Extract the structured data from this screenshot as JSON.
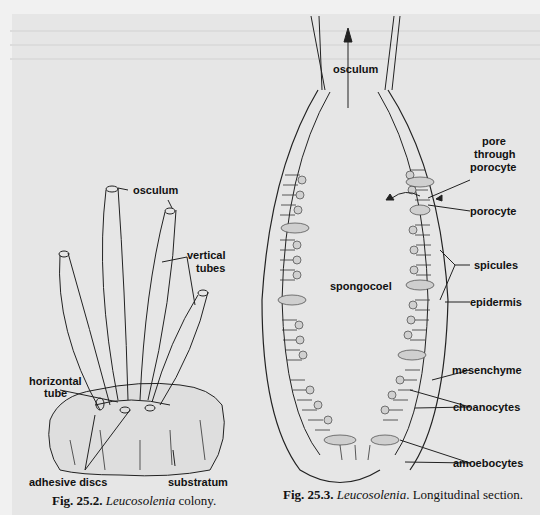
{
  "figure_left": {
    "number": "Fig. 25.2.",
    "genus": "Leucosolenia",
    "caption_rest": " colony.",
    "labels": {
      "osculum": "osculum",
      "vertical_tubes": "vertical\ntubes",
      "vertical_tubes_line1": "vertical",
      "vertical_tubes_line2": "tubes",
      "horizontal_tube_line1": "horizontal",
      "horizontal_tube_line2": "tube",
      "adhesive_discs": "adhesive discs",
      "substratum": "substratum"
    }
  },
  "figure_right": {
    "number": "Fig. 25.3.",
    "genus": "Leucosolenia",
    "caption_rest": ". Longitudinal section.",
    "labels": {
      "osculum": "osculum",
      "pore_line1": "pore",
      "pore_line2": "through",
      "pore_line3": "porocyte",
      "porocyte": "porocyte",
      "spicules": "spicules",
      "epidermis": "epidermis",
      "spongocoel": "spongocoel",
      "mesenchyme": "mesenchyme",
      "choanocytes": "choanocytes",
      "amoebocytes": "amoebocytes"
    }
  }
}
